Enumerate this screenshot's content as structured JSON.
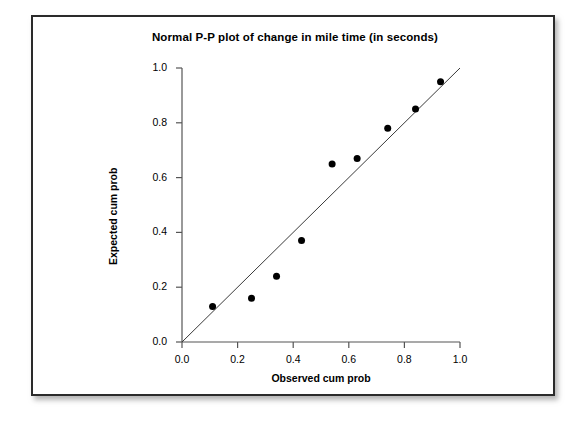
{
  "figure": {
    "title": "Normal P-P plot of change in mile time (in seconds)",
    "background_color": "#ffffff",
    "border_color": "#2b2b2b"
  },
  "chart_data": {
    "type": "scatter",
    "title": "Normal P-P plot of change in mile time (in seconds)",
    "xlabel": "Observed cum prob",
    "ylabel": "Expected cum prob",
    "xlim": [
      0.0,
      1.0
    ],
    "ylim": [
      0.0,
      1.0
    ],
    "xticks": [
      0.0,
      0.2,
      0.4,
      0.6,
      0.8,
      1.0
    ],
    "yticks": [
      0.0,
      0.2,
      0.4,
      0.6,
      0.8,
      1.0
    ],
    "xtick_labels": [
      "0.0",
      "0.2",
      "0.4",
      "0.6",
      "0.8",
      "1.0"
    ],
    "ytick_labels": [
      "0.0",
      "0.2",
      "0.4",
      "0.6",
      "0.8",
      "1.0"
    ],
    "grid": false,
    "legend": null,
    "marker_color": "#000000",
    "marker_size": 7,
    "reference_line": {
      "name": "identity-line",
      "from": [
        0.0,
        0.0
      ],
      "to": [
        1.0,
        1.0
      ],
      "color": "#3a3a3a",
      "width": 1
    },
    "series": [
      {
        "name": "change in mile time",
        "x": [
          0.11,
          0.25,
          0.34,
          0.43,
          0.54,
          0.63,
          0.74,
          0.84,
          0.93
        ],
        "y": [
          0.13,
          0.16,
          0.24,
          0.37,
          0.65,
          0.67,
          0.78,
          0.85,
          0.95
        ]
      }
    ]
  }
}
